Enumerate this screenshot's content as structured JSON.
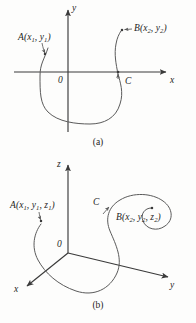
{
  "figure": {
    "background_color": "#fdfdfc",
    "stroke_color": "#4a4a4a",
    "axis_color": "#3a3a3a",
    "text_color": "#1d1d1d"
  },
  "panel_a": {
    "caption": "(a)",
    "axes": {
      "x_label": "x",
      "y_label": "y",
      "origin_label": "0"
    },
    "points": [
      {
        "name": "A",
        "label_main": "A",
        "label_open": "(",
        "coords": [
          {
            "var": "x",
            "sub": "1"
          },
          {
            "var": "y",
            "sub": "1"
          }
        ],
        "label_close": ")",
        "label_text": "A(x1, y1)"
      },
      {
        "name": "B",
        "label_main": "B",
        "label_open": "(",
        "coords": [
          {
            "var": "x",
            "sub": "2"
          },
          {
            "var": "y",
            "sub": "2"
          }
        ],
        "label_close": ")",
        "label_text": "B(x2, y2)"
      }
    ],
    "curve_label": "C"
  },
  "panel_b": {
    "caption": "(b)",
    "axes": {
      "x_label": "x",
      "y_label": "y",
      "z_label": "z",
      "origin_label": "0"
    },
    "points": [
      {
        "name": "A",
        "label_main": "A",
        "label_open": "(",
        "coords": [
          {
            "var": "x",
            "sub": "1"
          },
          {
            "var": "y",
            "sub": "1"
          },
          {
            "var": "z",
            "sub": "1"
          }
        ],
        "label_close": ")",
        "label_text": "A(x1, y1, z1)"
      },
      {
        "name": "B",
        "label_main": "B",
        "label_open": "(",
        "coords": [
          {
            "var": "x",
            "sub": "2"
          },
          {
            "var": "y",
            "sub": "2"
          },
          {
            "var": "z",
            "sub": "2"
          }
        ],
        "label_close": ")",
        "label_text": "B(x2, y2, z2)"
      }
    ],
    "curve_label": "C"
  }
}
